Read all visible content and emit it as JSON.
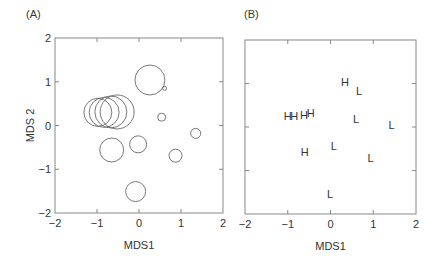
{
  "chart_data": [
    {
      "type": "scatter",
      "panel_label": "(A)",
      "marker": "bubble",
      "xlabel": "MDS1",
      "ylabel": "MDS 2",
      "xlim": [
        -2,
        2
      ],
      "ylim": [
        -2,
        2
      ],
      "xticks": [
        -2,
        -1,
        0,
        1,
        2
      ],
      "yticks": [
        -2,
        -1,
        0,
        1,
        2
      ],
      "grid": false,
      "points": [
        {
          "x": -0.98,
          "y": 0.3,
          "size": 14
        },
        {
          "x": -0.83,
          "y": 0.3,
          "size": 15
        },
        {
          "x": -0.67,
          "y": 0.31,
          "size": 16
        },
        {
          "x": -0.52,
          "y": 0.31,
          "size": 17
        },
        {
          "x": 0.26,
          "y": 1.04,
          "size": 15
        },
        {
          "x": 0.61,
          "y": 0.85,
          "size": 2
        },
        {
          "x": 0.54,
          "y": 0.19,
          "size": 4
        },
        {
          "x": 1.35,
          "y": -0.18,
          "size": 5
        },
        {
          "x": -0.65,
          "y": -0.56,
          "size": 12
        },
        {
          "x": -0.02,
          "y": -0.43,
          "size": 8.5
        },
        {
          "x": 0.87,
          "y": -0.69,
          "size": 6.5
        },
        {
          "x": -0.08,
          "y": -1.51,
          "size": 10
        }
      ]
    },
    {
      "type": "scatter",
      "panel_label": "(B)",
      "marker": "text",
      "xlabel": "MDS1",
      "ylabel": "",
      "xlim": [
        -2,
        2
      ],
      "ylim": [
        -2,
        2
      ],
      "xticks": [
        -2,
        -1,
        0,
        1,
        2
      ],
      "yticks": [],
      "grid": false,
      "points": [
        {
          "x": 0.34,
          "y": 1.03,
          "label": "H"
        },
        {
          "x": 0.67,
          "y": 0.82,
          "label": "L"
        },
        {
          "x": -1.0,
          "y": 0.26,
          "label": "H"
        },
        {
          "x": -0.85,
          "y": 0.26,
          "label": "H"
        },
        {
          "x": -0.62,
          "y": 0.28,
          "label": "H"
        },
        {
          "x": -0.46,
          "y": 0.33,
          "label": "H"
        },
        {
          "x": 0.6,
          "y": 0.18,
          "label": "L"
        },
        {
          "x": 1.43,
          "y": 0.05,
          "label": "L"
        },
        {
          "x": -0.6,
          "y": -0.57,
          "label": "H"
        },
        {
          "x": 0.08,
          "y": -0.44,
          "label": "L"
        },
        {
          "x": 0.94,
          "y": -0.72,
          "label": "L"
        },
        {
          "x": -0.01,
          "y": -1.54,
          "label": "L"
        }
      ]
    }
  ]
}
